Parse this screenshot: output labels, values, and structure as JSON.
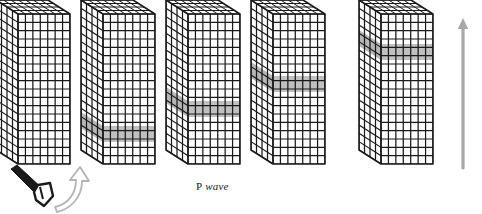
{
  "figure": {
    "title_label": "P wave",
    "label_parts": {
      "prefix": "P",
      "italic_word": "wave"
    },
    "caption_x": 196,
    "caption_y": 180,
    "background_color": "#ffffff",
    "line_color": "#1a1a1a",
    "band_color": "#9a9a9a",
    "arrow_color": "#a8a8a8",
    "hammer_color": "#1a1a1a",
    "icons": {
      "hammer": "hammer-icon",
      "swing_arrow": "curved-swing-arrow-icon",
      "propagation_arrow": "upward-propagation-arrow-icon"
    },
    "blocks": [
      {
        "index": 1,
        "name": "block-1",
        "origin_x": 18,
        "top_y": 14,
        "front_width": 52,
        "height": 150,
        "depth_x": 22,
        "depth_y": -14,
        "cols": 7,
        "rows": 18,
        "side_cols": 4,
        "band": null,
        "band_row": null
      },
      {
        "index": 2,
        "name": "block-2",
        "origin_x": 103,
        "top_y": 14,
        "front_width": 52,
        "height": 150,
        "depth_x": 22,
        "depth_y": -14,
        "cols": 7,
        "rows": 18,
        "side_cols": 4,
        "band": {
          "top": 126,
          "bottom": 142
        },
        "band_row": 14
      },
      {
        "index": 3,
        "name": "block-3",
        "origin_x": 188,
        "top_y": 14,
        "front_width": 52,
        "height": 150,
        "depth_x": 22,
        "depth_y": -14,
        "cols": 7,
        "rows": 18,
        "side_cols": 4,
        "band": {
          "top": 101,
          "bottom": 117
        },
        "band_row": 11
      },
      {
        "index": 4,
        "name": "block-4",
        "origin_x": 273,
        "top_y": 14,
        "front_width": 52,
        "height": 150,
        "depth_x": 22,
        "depth_y": -14,
        "cols": 7,
        "rows": 18,
        "side_cols": 4,
        "band": {
          "top": 76,
          "bottom": 92
        },
        "band_row": 8
      },
      {
        "index": 5,
        "name": "block-5",
        "origin_x": 381,
        "top_y": 14,
        "front_width": 52,
        "height": 150,
        "depth_x": 22,
        "depth_y": -14,
        "cols": 7,
        "rows": 18,
        "side_cols": 4,
        "band": {
          "top": 44,
          "bottom": 60
        },
        "band_row": 4
      }
    ],
    "propagation_arrow": {
      "name": "upward-propagation-arrow",
      "x": 463,
      "y_tail": 168,
      "y_head": 18,
      "color": "#a8a8a8",
      "width": 3.2
    },
    "hammer": {
      "name": "hammer",
      "handle_x1": 12,
      "handle_y1": 172,
      "handle_x2": 38,
      "handle_y2": 192,
      "head_cx": 41,
      "head_cy": 195,
      "color": "#1a1a1a"
    },
    "swing_arrow": {
      "name": "curved-swing-arrow",
      "color": "#b4b4b4",
      "start_x": 52,
      "start_y": 205,
      "end_x": 71,
      "end_y": 172
    }
  }
}
